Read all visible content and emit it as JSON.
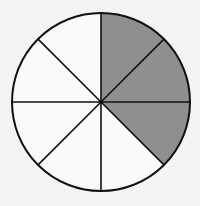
{
  "diagram": {
    "type": "fraction-circle",
    "total_sectors": 8,
    "shaded_sectors": 3,
    "shaded_indices": [
      0,
      1,
      2
    ],
    "center": [
      101,
      102
    ],
    "radius": 89,
    "colors": {
      "background": "#f4f4f4",
      "unshaded": "#fafafa",
      "shaded": "#8f8f8f",
      "stroke": "#111111"
    }
  }
}
